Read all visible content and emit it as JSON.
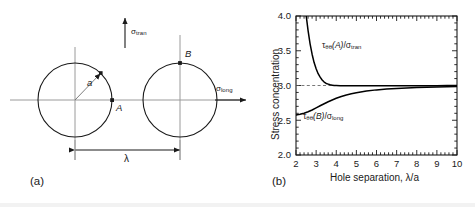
{
  "figure": {
    "panels": [
      {
        "letter": "(a)",
        "name": "two-hole-geometry-diagram",
        "labels": {
          "sigma_tran": {
            "base": "σ",
            "sub": "tran"
          },
          "sigma_long": {
            "base": "σ",
            "sub": "long"
          },
          "radius": "a",
          "separation": "λ",
          "point_a": "A",
          "point_b": "B"
        },
        "geometry": {
          "circle_left_center_x": 75,
          "circle_right_center_x": 180,
          "circle_center_y": 100,
          "circle_radius": 37,
          "point_a_description": "right edge of left circle",
          "point_b_description": "top of right circle"
        }
      },
      {
        "letter": "(b)",
        "name": "stress-concentration-plot"
      }
    ]
  },
  "chart_data": {
    "type": "line",
    "title": "",
    "xlabel": "Hole separation, λ/a",
    "ylabel": "Stress concentration",
    "xlim": [
      2,
      10
    ],
    "ylim": [
      2.0,
      4.0
    ],
    "xticks": [
      2,
      3,
      4,
      5,
      6,
      7,
      8,
      9,
      10
    ],
    "xtick_labels": [
      "2",
      "3",
      "4",
      "5",
      "6",
      "7",
      "8",
      "9",
      "10"
    ],
    "yticks": [
      2.0,
      2.5,
      3.0,
      3.5,
      4.0
    ],
    "ytick_labels": [
      "2.0",
      "2.5",
      "3.0",
      "3.5",
      "4.0"
    ],
    "grid": false,
    "minor_ticks": true,
    "legend": "inline-annotations",
    "reference_line": {
      "y": 3.0,
      "style": "dashed",
      "label": "3.0"
    },
    "annotations": [
      {
        "name": "curve-label-tau-A",
        "text": "τθθ(A)/σtran",
        "parts": {
          "tau": "τ",
          "tau_sub": "θθ",
          "point": "(A)",
          "slash": "/",
          "sigma": "σ",
          "sigma_sub": "tran"
        },
        "x": 3.6,
        "y": 3.52
      },
      {
        "name": "curve-label-tau-B",
        "text": "τθθ(B)/σlong",
        "parts": {
          "tau": "τ",
          "tau_sub": "θθ",
          "point": "(B)",
          "slash": "/",
          "sigma": "σ",
          "sigma_sub": "long"
        },
        "x": 3.5,
        "y": 2.47
      }
    ],
    "series": [
      {
        "name": "τθθ(A)/σtran",
        "x": [
          2.0,
          2.1,
          2.2,
          2.3,
          2.4,
          2.5,
          2.6,
          2.7,
          2.8,
          2.9,
          3.0,
          3.1,
          3.2,
          3.3,
          3.4,
          3.5,
          3.6,
          3.7,
          3.8,
          3.9,
          4.0,
          4.2,
          4.4,
          4.6,
          4.8,
          5.0,
          5.5,
          6.0,
          6.5,
          7.0,
          7.5,
          8.0,
          8.5,
          9.0,
          9.5,
          10.0
        ],
        "y": [
          6.8,
          5.9,
          5.2,
          4.7,
          4.32,
          4.02,
          3.79,
          3.6,
          3.45,
          3.33,
          3.24,
          3.17,
          3.12,
          3.08,
          3.05,
          3.03,
          3.02,
          3.01,
          3.005,
          3.0,
          3.0,
          2.998,
          2.997,
          2.996,
          2.996,
          2.995,
          2.995,
          2.995,
          2.996,
          2.996,
          2.997,
          2.997,
          2.998,
          2.998,
          2.999,
          2.999
        ],
        "color": "#000000",
        "style": "solid"
      },
      {
        "name": "τθθ(B)/σlong",
        "x": [
          2.0,
          2.2,
          2.4,
          2.6,
          2.8,
          3.0,
          3.2,
          3.4,
          3.6,
          3.8,
          4.0,
          4.25,
          4.5,
          4.75,
          5.0,
          5.5,
          6.0,
          6.5,
          7.0,
          7.5,
          8.0,
          8.5,
          9.0,
          9.5,
          10.0
        ],
        "y": [
          2.575,
          2.585,
          2.6,
          2.622,
          2.648,
          2.678,
          2.708,
          2.738,
          2.766,
          2.792,
          2.816,
          2.842,
          2.864,
          2.882,
          2.897,
          2.92,
          2.937,
          2.949,
          2.958,
          2.965,
          2.971,
          2.976,
          2.98,
          2.983,
          2.986
        ],
        "color": "#000000",
        "style": "solid"
      }
    ]
  }
}
